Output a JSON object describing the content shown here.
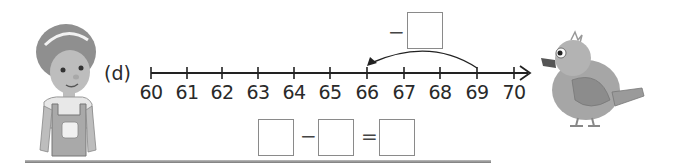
{
  "problem": {
    "part_label": "(d)",
    "number_line": {
      "start": 60,
      "end": 70,
      "ticks": [
        "60",
        "61",
        "62",
        "63",
        "64",
        "65",
        "66",
        "67",
        "68",
        "69",
        "70"
      ],
      "jump": {
        "from": 69,
        "to": 66,
        "direction": "left"
      }
    },
    "jump_operator": "−",
    "equation": {
      "operator": "−",
      "equals": "=",
      "boxes": [
        "",
        "",
        ""
      ]
    },
    "jump_box": ""
  },
  "illustrations": {
    "left": "child-character",
    "right": "bird-character"
  },
  "colors": {
    "line": "#222222",
    "box_border": "#8a8a8a",
    "figure_gray": "#9a9a9a"
  }
}
